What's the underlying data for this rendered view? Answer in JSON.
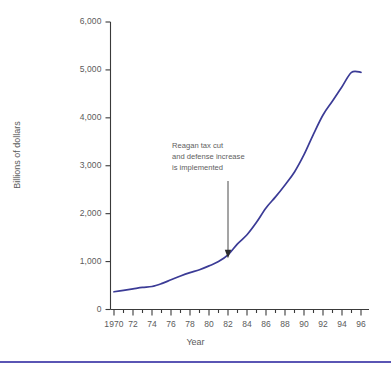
{
  "figure": {
    "background_color": "#ffffff",
    "rule_color": "#5a55b4"
  },
  "chart_data": {
    "type": "line",
    "title": "",
    "subtitle": "",
    "xlabel": "Year",
    "ylabel": "Billions of dollars",
    "xlim": [
      1970,
      1996
    ],
    "ylim": [
      0,
      6000
    ],
    "grid": false,
    "legend": "none",
    "line_color": "#3b3b96",
    "x_tick_labels": [
      "1970",
      "72",
      "74",
      "76",
      "78",
      "80",
      "82",
      "84",
      "86",
      "88",
      "90",
      "92",
      "94",
      "96"
    ],
    "x_tick_values": [
      1970,
      1972,
      1974,
      1976,
      1978,
      1980,
      1982,
      1984,
      1986,
      1988,
      1990,
      1992,
      1994,
      1996
    ],
    "x_minor_ticks": [
      1971,
      1973,
      1975,
      1977,
      1979,
      1981,
      1983,
      1985,
      1987,
      1989,
      1991,
      1993,
      1995
    ],
    "y_tick_labels": [
      "0",
      "1,000",
      "2,000",
      "3,000",
      "4,000",
      "5,000",
      "6,000"
    ],
    "y_tick_values": [
      0,
      1000,
      2000,
      3000,
      4000,
      5000,
      6000
    ],
    "series": [
      {
        "name": "Gross federal debt",
        "x": [
          1970,
          1971,
          1972,
          1973,
          1974,
          1975,
          1976,
          1977,
          1978,
          1979,
          1980,
          1981,
          1982,
          1983,
          1984,
          1985,
          1986,
          1987,
          1988,
          1989,
          1990,
          1991,
          1992,
          1993,
          1994,
          1995,
          1996
        ],
        "values": [
          370,
          400,
          430,
          460,
          480,
          540,
          620,
          700,
          770,
          830,
          910,
          1000,
          1140,
          1370,
          1560,
          1820,
          2120,
          2350,
          2600,
          2870,
          3230,
          3660,
          4060,
          4350,
          4650,
          4950,
          4950
        ]
      }
    ],
    "annotations": [
      {
        "name": "reagan-annotation",
        "lines": [
          "Reagan tax cut",
          "and defense increase",
          "is implemented"
        ],
        "arrow_at_x": 1982,
        "arrow_at_y": 1100
      }
    ]
  }
}
